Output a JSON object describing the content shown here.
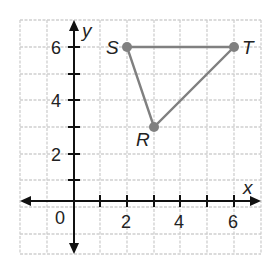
{
  "graph": {
    "x_axis_label": "x",
    "y_axis_label": "y",
    "origin_label": "0",
    "x_tick_labels": [
      "2",
      "4",
      "6"
    ],
    "y_tick_labels": [
      "2",
      "4",
      "6"
    ],
    "grid_color": "#cccccc",
    "axis_color": "#111111",
    "triangle_color": "#808080",
    "points": [
      {
        "name": "S",
        "x": 2,
        "y": 6
      },
      {
        "name": "T",
        "x": 6,
        "y": 6
      },
      {
        "name": "R",
        "x": 3,
        "y": 3
      }
    ]
  }
}
